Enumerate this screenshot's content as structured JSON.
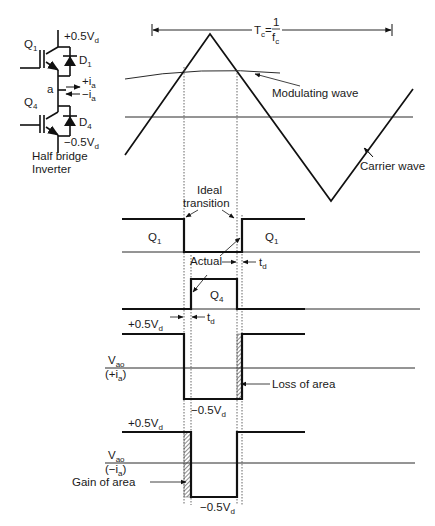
{
  "circuit": {
    "title_line1": "Half bridge",
    "title_line2": "Inverter",
    "q1": "Q",
    "q1_sub": "1",
    "q4": "Q",
    "q4_sub": "4",
    "d1": "D",
    "d1_sub": "1",
    "d4": "D",
    "d4_sub": "4",
    "node": "a",
    "top_rail": "+0.5V",
    "top_rail_sub": "d",
    "bottom_rail": "−0.5V",
    "bottom_rail_sub": "d",
    "current_pos": "+i",
    "current_pos_sub": "a",
    "current_neg": "−i",
    "current_neg_sub": "a"
  },
  "period": {
    "label": "T",
    "label_sub": "c",
    "equals": "=",
    "numerator": "1",
    "denominator": "f",
    "denominator_sub": "c"
  },
  "carrier": {
    "modulating_label": "Modulating wave",
    "carrier_label": "Carrier wave"
  },
  "annotations": {
    "ideal_line1": "Ideal",
    "ideal_line2": "transition",
    "actual": "Actual",
    "td": "t",
    "td_sub": "d",
    "td2": "t",
    "td2_sub": "d",
    "loss": "Loss of area",
    "gain": "Gain of area"
  },
  "waveforms": {
    "q1_left": "Q",
    "q1_left_sub": "1",
    "q1_right": "Q",
    "q1_right_sub": "1",
    "q4": "Q",
    "q4_sub": "4",
    "vao_pos_label": "V",
    "vao_pos_label_sub": "ao",
    "vao_pos_current": "(+i",
    "vao_pos_current_sub": "a",
    "vao_pos_close": ")",
    "vao_pos_high": "+0.5V",
    "vao_pos_high_sub": "d",
    "vao_pos_low": "−0.5V",
    "vao_pos_low_sub": "d",
    "vao_neg_label": "V",
    "vao_neg_label_sub": "ao",
    "vao_neg_current": "(−i",
    "vao_neg_current_sub": "a",
    "vao_neg_close": ")",
    "vao_neg_high": "+0.5V",
    "vao_neg_high_sub": "d",
    "vao_neg_low": "−0.5V",
    "vao_neg_low_sub": "d"
  }
}
